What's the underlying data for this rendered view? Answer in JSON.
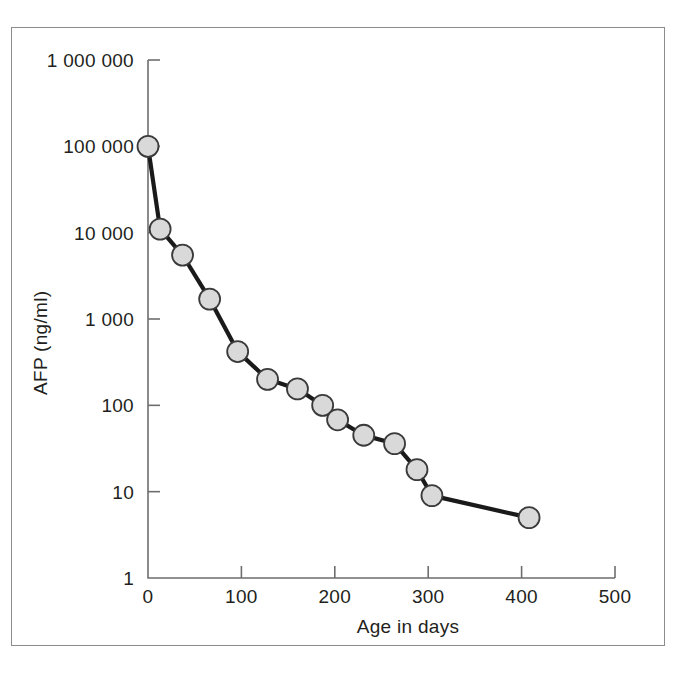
{
  "chart_data": {
    "type": "line",
    "title": "",
    "xlabel": "Age in days",
    "ylabel": "AFP (ng/ml)",
    "yscale": "log",
    "xscale": "linear",
    "xlim": [
      0,
      500
    ],
    "ylim": [
      1,
      1000000
    ],
    "grid": false,
    "legend": null,
    "xticks": [
      0,
      100,
      200,
      300,
      400,
      500
    ],
    "xtick_labels": [
      "0",
      "100",
      "200",
      "300",
      "400",
      "500"
    ],
    "yticks": [
      1,
      10,
      100,
      1000,
      10000,
      100000,
      1000000
    ],
    "ytick_labels": [
      "1",
      "10",
      "100",
      "1 000",
      "10 000",
      "100 000",
      "1 000 000"
    ],
    "series": [
      {
        "name": "AFP",
        "marker": "circle",
        "marker_face_color": "#d9d9d9",
        "marker_edge_color": "#3a3a3a",
        "line_color": "#1a1a1a",
        "x": [
          0,
          13,
          37,
          66,
          96,
          128,
          160,
          187,
          203,
          231,
          264,
          288,
          304,
          408
        ],
        "y": [
          100000,
          11000,
          5500,
          1700,
          420,
          200,
          155,
          100,
          68,
          45,
          36,
          18,
          9,
          5
        ]
      }
    ]
  },
  "colors": {
    "frame_border": "#8c8c8c",
    "axis": "#6e6e6e",
    "text": "#231f20",
    "marker_fill": "#d9d9d9",
    "marker_stroke": "#3a3a3a",
    "line": "#1a1a1a",
    "background": "#ffffff"
  }
}
